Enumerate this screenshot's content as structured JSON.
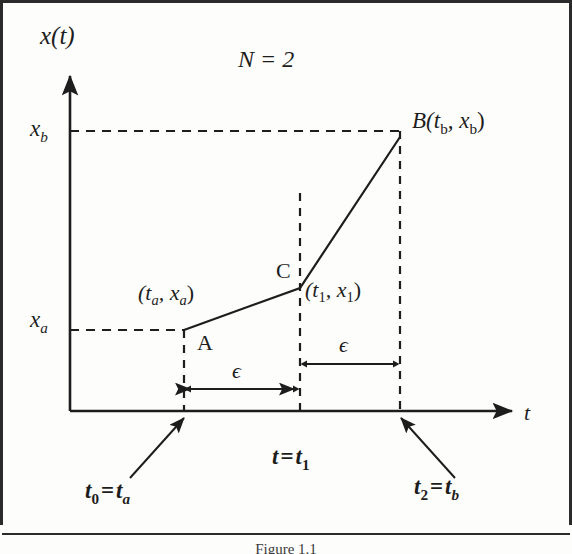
{
  "figure": {
    "caption": "Figure 1.1",
    "title_label": "N = 2",
    "axes": {
      "y_axis_label": "x(t)",
      "x_axis_label": "t",
      "y_ticks": [
        {
          "name": "x_b",
          "base": "x",
          "sub": "b",
          "y_px": 131
        },
        {
          "name": "x_a",
          "base": "x",
          "sub": "a",
          "y_px": 322
        }
      ]
    },
    "points": [
      {
        "id": "A",
        "marker_label": "A",
        "coord_label_base": "(t",
        "coord_label": "(t_a, x_a)",
        "x_px": 184,
        "y_px": 330
      },
      {
        "id": "C",
        "marker_label": "C",
        "coord_label": "(t_1, x_1)",
        "x_px": 300,
        "y_px": 288
      },
      {
        "id": "B",
        "marker_label": "B(t_b, x_b)",
        "x_px": 400,
        "y_px": 137
      }
    ],
    "coord_labels": {
      "a_point": {
        "open": "(t",
        "sub1": "a",
        "comma": ", x",
        "sub2": "a",
        "close": ")"
      },
      "c_point": {
        "open": "(t",
        "sub1": "1",
        "comma": ", x",
        "sub2": "1",
        "close": ")"
      },
      "b_point": {
        "name": "B",
        "open": "(t",
        "sub1": "b",
        "comma": ", x",
        "sub2": "b",
        "close": ")"
      }
    },
    "marker_a": "A",
    "marker_c": "C",
    "epsilon_symbol": "ϵ",
    "epsilon_left_label": "ϵ",
    "epsilon_right_label": "ϵ",
    "bottom_labels": {
      "t0": {
        "base": "t",
        "sub": "0",
        "eq": "=",
        "rhs_base": "t",
        "rhs_sub": "a",
        "full": "t0 = ta"
      },
      "t1_center": {
        "lhs": "t",
        "eq": "=",
        "rhs_base": "t",
        "rhs_sub": "1",
        "full": "t = t1"
      },
      "t2": {
        "base": "t",
        "sub": "2",
        "eq": "=",
        "rhs_base": "t",
        "rhs_sub": "b",
        "full": "t2 = tb"
      }
    },
    "colors": {
      "ink": "#1d1d1d",
      "frame": "#2b2b2b",
      "paper": "#fdfdfc"
    }
  }
}
